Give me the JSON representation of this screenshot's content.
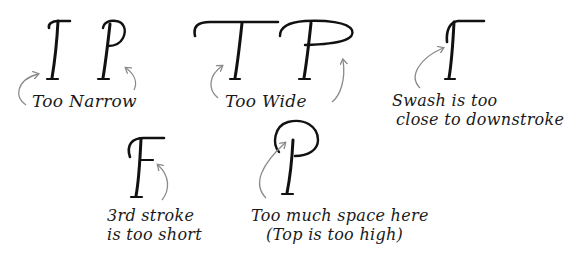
{
  "diagram": {
    "colors": {
      "ink": "#111111",
      "arrow": "#8a8a8a",
      "background": "#ffffff"
    },
    "examples": [
      {
        "id": "too-narrow",
        "letters": [
          "T",
          "P"
        ],
        "caption_lines": [
          "Too Narrow"
        ]
      },
      {
        "id": "too-wide",
        "letters": [
          "T",
          "P"
        ],
        "caption_lines": [
          "Too Wide"
        ]
      },
      {
        "id": "swash-close",
        "letters": [
          "T"
        ],
        "caption_lines": [
          "Swash is too",
          "close to downstroke"
        ]
      },
      {
        "id": "third-stroke-short",
        "letters": [
          "F"
        ],
        "caption_lines": [
          "3rd stroke",
          "is too short"
        ]
      },
      {
        "id": "too-much-space",
        "letters": [
          "P"
        ],
        "caption_lines": [
          "Too much space here",
          "(Top is too high)"
        ]
      }
    ]
  }
}
